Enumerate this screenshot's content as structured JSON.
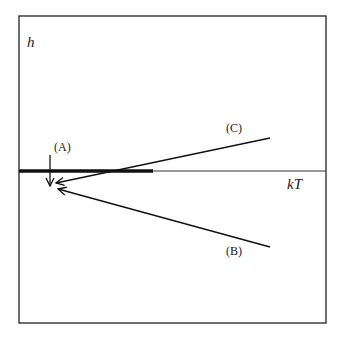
{
  "diagram": {
    "axis_labels": {
      "vertical": "h",
      "horizontal": "kT"
    },
    "paths": [
      {
        "label": "(A)",
        "description": "vertical arrow down onto point below axis"
      },
      {
        "label": "(B)",
        "description": "line from lower right to point"
      },
      {
        "label": "(C)",
        "description": "line from upper right crossing axis to point"
      }
    ],
    "colors": {
      "line": "#111111",
      "frame": "#222222"
    }
  }
}
